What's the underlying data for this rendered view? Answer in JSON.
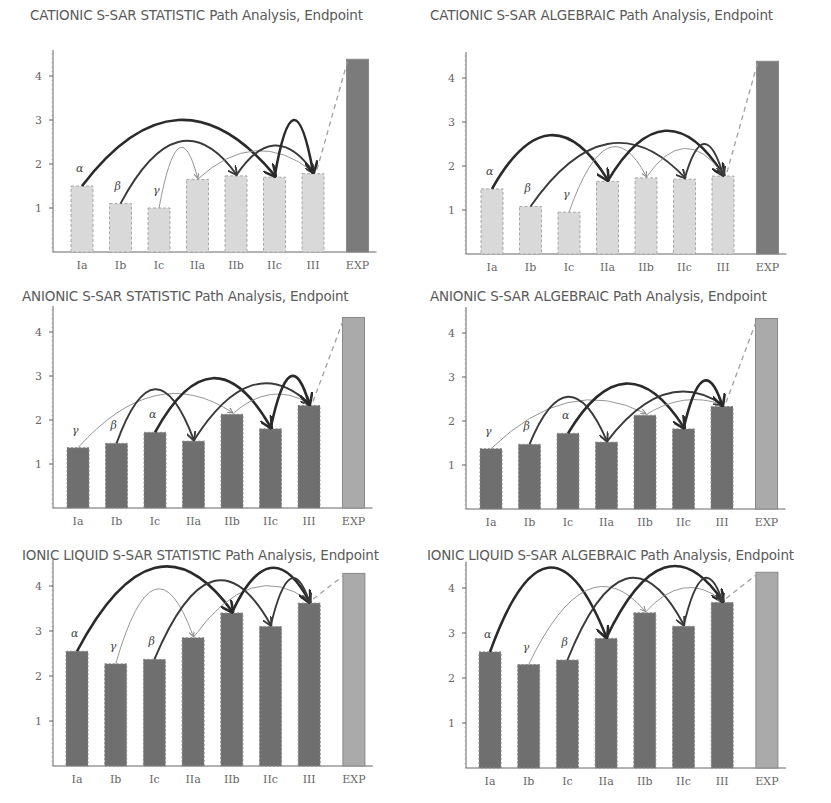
{
  "chart_data": [
    {
      "id": "p1",
      "type": "bar",
      "title": "CATIONIC S-SAR STATISTIC Path Analysis, Endpoint",
      "categories": [
        "Ia",
        "Ib",
        "Ic",
        "IIa",
        "IIb",
        "IIc",
        "III",
        "EXP"
      ],
      "values": [
        1.5,
        1.1,
        1.0,
        1.65,
        1.73,
        1.7,
        1.78,
        4.38
      ],
      "ylim": [
        0,
        4.5
      ],
      "yticks": [
        1,
        2,
        3,
        4
      ],
      "xlabel": "",
      "ylabel": "",
      "grid": false,
      "legend": null,
      "bar_style": "light",
      "path_labels": [
        {
          "label": "α",
          "from": "Ia"
        },
        {
          "label": "β",
          "from": "Ib"
        },
        {
          "label": "γ",
          "from": "Ic"
        }
      ],
      "arrows": [
        {
          "from": "Ia",
          "to": "IIc",
          "peak": 3.0,
          "weight": "heavy"
        },
        {
          "from": "Ib",
          "to": "IIb",
          "peak": 2.5,
          "weight": "medium"
        },
        {
          "from": "Ic",
          "to": "IIa",
          "peak": 2.35,
          "weight": "thin"
        },
        {
          "from": "IIa",
          "to": "III",
          "peak": 2.3,
          "weight": "thin"
        },
        {
          "from": "IIb",
          "to": "III",
          "peak": 2.42,
          "weight": "medium"
        },
        {
          "from": "IIc",
          "to": "III",
          "peak": 3.0,
          "weight": "heavy"
        }
      ],
      "dashed_link": {
        "from": "III",
        "to": "EXP"
      }
    },
    {
      "id": "p2",
      "type": "bar",
      "title": "CATIONIC S-SAR ALGEBRAIC Path Analysis, Endpoint",
      "categories": [
        "Ia",
        "Ib",
        "Ic",
        "IIa",
        "IIb",
        "IIc",
        "III",
        "EXP"
      ],
      "values": [
        1.48,
        1.08,
        0.95,
        1.65,
        1.73,
        1.7,
        1.77,
        4.38
      ],
      "ylim": [
        0,
        4.5
      ],
      "yticks": [
        1,
        2,
        3,
        4
      ],
      "xlabel": "",
      "ylabel": "",
      "grid": false,
      "legend": null,
      "bar_style": "light",
      "path_labels": [
        {
          "label": "α",
          "from": "Ia"
        },
        {
          "label": "β",
          "from": "Ib"
        },
        {
          "label": "γ",
          "from": "Ic"
        }
      ],
      "arrows": [
        {
          "from": "Ia",
          "to": "IIa",
          "peak": 2.7,
          "weight": "heavy"
        },
        {
          "from": "Ib",
          "to": "IIc",
          "peak": 2.5,
          "weight": "medium"
        },
        {
          "from": "Ic",
          "to": "IIb",
          "peak": 2.4,
          "weight": "thin"
        },
        {
          "from": "IIa",
          "to": "III",
          "peak": 2.8,
          "weight": "heavy"
        },
        {
          "from": "IIb",
          "to": "III",
          "peak": 2.4,
          "weight": "thin"
        },
        {
          "from": "IIc",
          "to": "III",
          "peak": 2.5,
          "weight": "medium"
        }
      ],
      "dashed_link": {
        "from": "III",
        "to": "EXP"
      }
    },
    {
      "id": "p3",
      "type": "bar",
      "title": "ANIONIC S-SAR STATISTIC Path Analysis, Endpoint",
      "categories": [
        "Ia",
        "Ib",
        "Ic",
        "IIa",
        "IIb",
        "IIc",
        "III",
        "EXP"
      ],
      "values": [
        1.37,
        1.47,
        1.72,
        1.52,
        2.13,
        1.8,
        2.33,
        4.33
      ],
      "ylim": [
        0,
        4.5
      ],
      "yticks": [
        1,
        2,
        3,
        4
      ],
      "xlabel": "",
      "ylabel": "",
      "grid": false,
      "legend": null,
      "bar_style": "dark",
      "path_labels": [
        {
          "label": "γ",
          "from": "Ia"
        },
        {
          "label": "β",
          "from": "Ib"
        },
        {
          "label": "α",
          "from": "Ic"
        }
      ],
      "arrows": [
        {
          "from": "Ia",
          "to": "IIb",
          "peak": 2.55,
          "weight": "thin"
        },
        {
          "from": "Ib",
          "to": "IIa",
          "peak": 2.7,
          "weight": "medium"
        },
        {
          "from": "Ic",
          "to": "IIc",
          "peak": 2.95,
          "weight": "heavy"
        },
        {
          "from": "IIa",
          "to": "III",
          "peak": 2.78,
          "weight": "medium"
        },
        {
          "from": "IIb",
          "to": "III",
          "peak": 2.58,
          "weight": "thin"
        },
        {
          "from": "IIc",
          "to": "III",
          "peak": 2.98,
          "weight": "heavy"
        }
      ],
      "dashed_link": {
        "from": "III",
        "to": "EXP"
      }
    },
    {
      "id": "p4",
      "type": "bar",
      "title": "ANIONIC S-SAR ALGEBRAIC Path Analysis, Endpoint",
      "categories": [
        "Ia",
        "Ib",
        "Ic",
        "IIa",
        "IIb",
        "IIc",
        "III",
        "EXP"
      ],
      "values": [
        1.37,
        1.47,
        1.72,
        1.52,
        2.13,
        1.82,
        2.33,
        4.33
      ],
      "ylim": [
        0,
        4.5
      ],
      "yticks": [
        1,
        2,
        3,
        4
      ],
      "xlabel": "",
      "ylabel": "",
      "grid": false,
      "legend": null,
      "bar_style": "dark",
      "path_labels": [
        {
          "label": "γ",
          "from": "Ia"
        },
        {
          "label": "β",
          "from": "Ib"
        },
        {
          "label": "α",
          "from": "Ic"
        }
      ],
      "arrows": [
        {
          "from": "Ia",
          "to": "IIb",
          "peak": 2.42,
          "weight": "thin"
        },
        {
          "from": "Ib",
          "to": "IIa",
          "peak": 2.55,
          "weight": "medium"
        },
        {
          "from": "Ic",
          "to": "IIc",
          "peak": 2.85,
          "weight": "heavy"
        },
        {
          "from": "IIa",
          "to": "III",
          "peak": 2.6,
          "weight": "medium"
        },
        {
          "from": "IIb",
          "to": "III",
          "peak": 2.47,
          "weight": "thin"
        },
        {
          "from": "IIc",
          "to": "III",
          "peak": 2.9,
          "weight": "heavy"
        }
      ],
      "dashed_link": {
        "from": "III",
        "to": "EXP"
      }
    },
    {
      "id": "p5",
      "type": "bar",
      "title": "IONIC LIQUID S-SAR STATISTIC Path Analysis, Endpoint",
      "categories": [
        "Ia",
        "Ib",
        "Ic",
        "IIa",
        "IIb",
        "IIc",
        "III",
        "EXP"
      ],
      "values": [
        2.55,
        2.27,
        2.37,
        2.85,
        3.4,
        3.1,
        3.62,
        4.28
      ],
      "ylim": [
        0,
        4.5
      ],
      "yticks": [
        1,
        2,
        3,
        4
      ],
      "xlabel": "",
      "ylabel": "",
      "grid": false,
      "legend": null,
      "bar_style": "dark",
      "path_labels": [
        {
          "label": "α",
          "from": "Ia"
        },
        {
          "label": "γ",
          "from": "Ib"
        },
        {
          "label": "β",
          "from": "Ic"
        }
      ],
      "arrows": [
        {
          "from": "Ia",
          "to": "IIb",
          "peak": 4.4,
          "weight": "heavy"
        },
        {
          "from": "Ib",
          "to": "IIa",
          "peak": 3.92,
          "weight": "thin"
        },
        {
          "from": "Ic",
          "to": "IIc",
          "peak": 4.1,
          "weight": "medium"
        },
        {
          "from": "IIa",
          "to": "III",
          "peak": 3.95,
          "weight": "thin"
        },
        {
          "from": "IIb",
          "to": "III",
          "peak": 4.4,
          "weight": "heavy"
        },
        {
          "from": "IIc",
          "to": "III",
          "peak": 4.15,
          "weight": "medium"
        }
      ],
      "dashed_link": {
        "from": "III",
        "to": "EXP"
      }
    },
    {
      "id": "p6",
      "type": "bar",
      "title": "IONIC LIQUID S-SAR ALGEBRAIC Path Analysis, Endpoint",
      "categories": [
        "Ia",
        "Ib",
        "Ic",
        "IIa",
        "IIb",
        "IIc",
        "III",
        "EXP"
      ],
      "values": [
        2.58,
        2.3,
        2.4,
        2.88,
        3.45,
        3.15,
        3.68,
        4.35
      ],
      "ylim": [
        0,
        4.5
      ],
      "yticks": [
        1,
        2,
        3,
        4
      ],
      "xlabel": "",
      "ylabel": "",
      "grid": false,
      "legend": null,
      "bar_style": "dark",
      "path_labels": [
        {
          "label": "α",
          "from": "Ia"
        },
        {
          "label": "γ",
          "from": "Ib"
        },
        {
          "label": "β",
          "from": "Ic"
        }
      ],
      "arrows": [
        {
          "from": "Ia",
          "to": "IIa",
          "peak": 4.45,
          "weight": "heavy"
        },
        {
          "from": "Ib",
          "to": "IIb",
          "peak": 3.95,
          "weight": "thin"
        },
        {
          "from": "Ic",
          "to": "IIc",
          "peak": 4.2,
          "weight": "medium"
        },
        {
          "from": "IIa",
          "to": "III",
          "peak": 4.45,
          "weight": "heavy"
        },
        {
          "from": "IIb",
          "to": "III",
          "peak": 4.0,
          "weight": "thin"
        },
        {
          "from": "IIc",
          "to": "III",
          "peak": 4.2,
          "weight": "medium"
        }
      ],
      "dashed_link": {
        "from": "III",
        "to": "EXP"
      }
    }
  ],
  "colors": {
    "light_bar": "#d9d9d9",
    "light_bar_border": "#a8a8a8",
    "dark_bar": "#6f6f6f",
    "dark_bar_border": "#8a8a8a",
    "exp_bar_top": "#7b7b7b",
    "exp_bar_bottom": "#aaaaaa",
    "axis": "#666666",
    "arrow_heavy": "#2a2a2a",
    "arrow_medium": "#3a3a3a",
    "arrow_thin": "#8a8a8a",
    "dashed_link": "#a0a0a0"
  }
}
